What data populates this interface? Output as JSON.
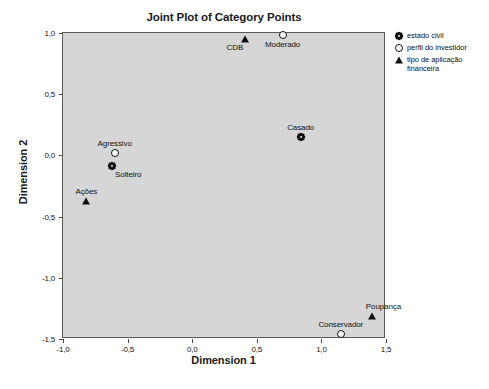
{
  "chart_data": {
    "type": "scatter",
    "title": "Joint Plot of Category Points",
    "xlabel": "Dimension 1",
    "ylabel": "Dimension 2",
    "xlim": [
      -1.0,
      1.5
    ],
    "ylim": [
      -1.5,
      1.0
    ],
    "xticks": [
      "-1,0",
      "-0,5",
      "0,0",
      "0,5",
      "1,0",
      "1,5"
    ],
    "xtick_values": [
      -1.0,
      -0.5,
      0.0,
      0.5,
      1.0,
      1.5
    ],
    "yticks": [
      "1,0",
      "0,5",
      "0,0",
      "-0,5",
      "-1,0",
      "-1,5"
    ],
    "ytick_values": [
      1.0,
      0.5,
      0.0,
      -0.5,
      -1.0,
      -1.5
    ],
    "grid": false,
    "legend_position": "right",
    "plot_background": "#d6d6d6",
    "marker_color": "#111111",
    "series": [
      {
        "name": "estado civil",
        "marker": "star-icon",
        "points": [
          {
            "label": "Casado",
            "x": 0.84,
            "y": 0.15,
            "label_pos": "above"
          },
          {
            "label": "Solteiro",
            "x": -0.62,
            "y": -0.09,
            "label_pos": "below-right"
          }
        ]
      },
      {
        "name": "perfil do investidor",
        "marker": "open-circle-icon",
        "points": [
          {
            "label": "Moderado",
            "x": 0.7,
            "y": 0.98,
            "label_pos": "below"
          },
          {
            "label": "Agressivo",
            "x": -0.6,
            "y": 0.02,
            "label_pos": "above"
          },
          {
            "label": "Conservador",
            "x": 1.15,
            "y": -1.46,
            "label_pos": "above"
          }
        ]
      },
      {
        "name": "tipo de aplicação financeira",
        "marker": "filled-triangle-icon",
        "points": [
          {
            "label": "CDB",
            "x": 0.41,
            "y": 0.95,
            "label_pos": "below-left"
          },
          {
            "label": "Ações",
            "x": -0.82,
            "y": -0.37,
            "label_pos": "above"
          },
          {
            "label": "Poupança",
            "x": 1.39,
            "y": -1.31,
            "label_pos": "above-right"
          }
        ]
      }
    ]
  },
  "legend": {
    "items": [
      {
        "marker": "star-icon",
        "label": "estado civil"
      },
      {
        "marker": "open-circle-icon",
        "label": "perfil do investidor"
      },
      {
        "marker": "filled-triangle-icon",
        "label": "tipo de aplicação\nfinanceira"
      }
    ]
  }
}
